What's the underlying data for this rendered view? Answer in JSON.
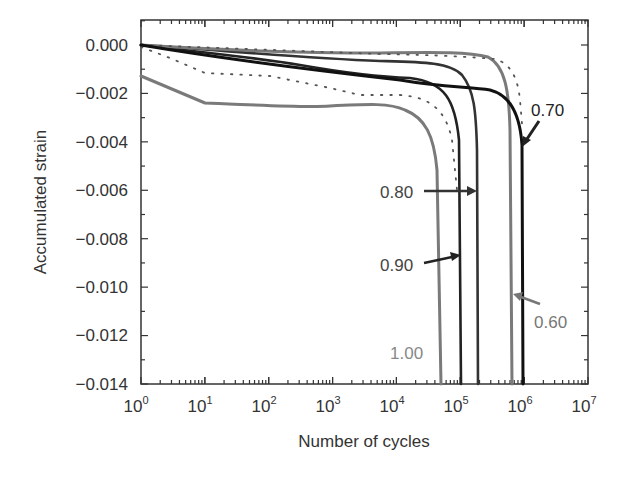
{
  "chart_data": {
    "type": "line",
    "title": "",
    "xlabel": "Number of cycles",
    "ylabel": "Accumulated strain",
    "xscale": "log",
    "xlim": [
      1,
      10000000
    ],
    "ylim": [
      -0.014,
      0.001
    ],
    "x_ticks": [
      {
        "base": "10",
        "exp": "0"
      },
      {
        "base": "10",
        "exp": "1"
      },
      {
        "base": "10",
        "exp": "2"
      },
      {
        "base": "10",
        "exp": "3"
      },
      {
        "base": "10",
        "exp": "4"
      },
      {
        "base": "10",
        "exp": "5"
      },
      {
        "base": "10",
        "exp": "6"
      },
      {
        "base": "10",
        "exp": "7"
      }
    ],
    "y_ticks": [
      "0.000",
      "−0.002",
      "−0.004",
      "−0.006",
      "−0.008",
      "−0.010",
      "−0.012",
      "−0.014"
    ],
    "grid": false,
    "legend": "inline labels with arrows",
    "series": [
      {
        "name": "1.00",
        "color": "#777777",
        "style": "solid",
        "points": [
          [
            1,
            -0.0013
          ],
          [
            10,
            -0.0024
          ],
          [
            100,
            -0.0025
          ],
          [
            1000,
            -0.0024
          ],
          [
            10000,
            -0.0026
          ],
          [
            30000,
            -0.0045
          ],
          [
            55000,
            -0.014
          ]
        ]
      },
      {
        "name": "0.90",
        "color": "#222222",
        "style": "solid",
        "points": [
          [
            1,
            0.0
          ],
          [
            100,
            -0.0008
          ],
          [
            10000,
            -0.0014
          ],
          [
            60000,
            -0.0025
          ],
          [
            110000,
            -0.014
          ]
        ]
      },
      {
        "name": "0.80",
        "color": "#333333",
        "style": "solid",
        "points": [
          [
            1,
            0.0
          ],
          [
            1000,
            -0.0005
          ],
          [
            30000,
            -0.0006
          ],
          [
            150000,
            -0.0025
          ],
          [
            200000,
            -0.014
          ]
        ]
      },
      {
        "name": "0.70",
        "color": "#111111",
        "style": "solid",
        "points": [
          [
            1,
            0.0
          ],
          [
            1000,
            -0.0013
          ],
          [
            100000,
            -0.0016
          ],
          [
            400000,
            -0.002
          ],
          [
            1100000,
            -0.004
          ],
          [
            1150000,
            -0.014
          ]
        ]
      },
      {
        "name": "0.60",
        "color": "#777777",
        "style": "solid",
        "points": [
          [
            1,
            0.0
          ],
          [
            10000,
            -0.0001
          ],
          [
            100000,
            -0.0003
          ],
          [
            500000,
            -0.0018
          ],
          [
            700000,
            -0.014
          ]
        ]
      },
      {
        "name": "dotted-a",
        "color": "#555555",
        "style": "dotted",
        "points": [
          [
            1,
            0.0
          ],
          [
            100,
            -0.0002
          ],
          [
            100000,
            -0.0003
          ],
          [
            800000,
            -0.0015
          ],
          [
            1200000,
            -0.004
          ]
        ]
      },
      {
        "name": "dotted-b",
        "color": "#555555",
        "style": "dotted",
        "points": [
          [
            1,
            -0.0001
          ],
          [
            30,
            -0.0012
          ],
          [
            1000,
            -0.0015
          ],
          [
            10000,
            -0.0019
          ],
          [
            60000,
            -0.0025
          ],
          [
            120000,
            -0.006
          ]
        ]
      }
    ],
    "annotations": [
      {
        "text": "0.70",
        "color": "#222222"
      },
      {
        "text": "0.80",
        "color": "#444444"
      },
      {
        "text": "0.90",
        "color": "#444444"
      },
      {
        "text": "0.60",
        "color": "#777777"
      },
      {
        "text": "1.00",
        "color": "#888888"
      }
    ]
  }
}
